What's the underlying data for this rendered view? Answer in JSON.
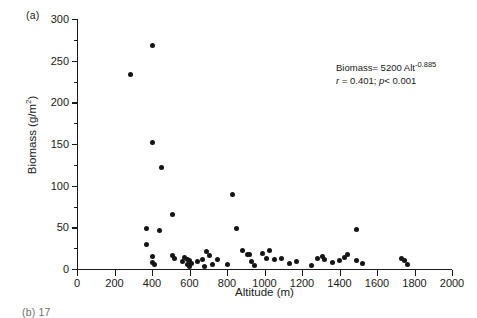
{
  "panel": {
    "label": "(a)",
    "next_panel_stub": "(b)  17"
  },
  "chart_data": {
    "type": "scatter",
    "title": "",
    "xlabel": "Altitude (m)",
    "ylabel": "Biomass (g/m",
    "ylabel_exponent": "2",
    "ylabel_close": ")",
    "xlim": [
      0,
      2000
    ],
    "ylim": [
      0,
      300
    ],
    "xticks": [
      0,
      200,
      400,
      600,
      800,
      1000,
      1200,
      1400,
      1600,
      1800,
      2000
    ],
    "xtick_labels": [
      "0",
      "200",
      "400",
      "600",
      "800",
      "1000",
      "1200",
      "1400",
      "1600",
      "1800",
      "2000"
    ],
    "yticks": [
      0,
      50,
      100,
      150,
      200,
      250,
      300
    ],
    "ytick_labels": [
      "0",
      "50",
      "100",
      "150",
      "200",
      "250",
      "300"
    ],
    "yticks_minor": [
      25,
      75,
      125,
      175,
      225,
      275
    ],
    "grid": false,
    "legend": null,
    "marker": "filled-circle",
    "marker_color": "#151515",
    "points": [
      {
        "x": 287,
        "y": 234
      },
      {
        "x": 400,
        "y": 268
      },
      {
        "x": 400,
        "y": 152
      },
      {
        "x": 453,
        "y": 122
      },
      {
        "x": 507,
        "y": 65
      },
      {
        "x": 373,
        "y": 49
      },
      {
        "x": 440,
        "y": 46
      },
      {
        "x": 373,
        "y": 29
      },
      {
        "x": 400,
        "y": 15
      },
      {
        "x": 400,
        "y": 8
      },
      {
        "x": 413,
        "y": 5
      },
      {
        "x": 507,
        "y": 16
      },
      {
        "x": 520,
        "y": 13
      },
      {
        "x": 560,
        "y": 9
      },
      {
        "x": 573,
        "y": 14
      },
      {
        "x": 587,
        "y": 12
      },
      {
        "x": 587,
        "y": 5
      },
      {
        "x": 600,
        "y": 10
      },
      {
        "x": 600,
        "y": 3
      },
      {
        "x": 613,
        "y": 7
      },
      {
        "x": 640,
        "y": 9
      },
      {
        "x": 667,
        "y": 12
      },
      {
        "x": 680,
        "y": 3
      },
      {
        "x": 693,
        "y": 21
      },
      {
        "x": 707,
        "y": 16
      },
      {
        "x": 720,
        "y": 5
      },
      {
        "x": 747,
        "y": 11
      },
      {
        "x": 800,
        "y": 6
      },
      {
        "x": 827,
        "y": 89
      },
      {
        "x": 853,
        "y": 49
      },
      {
        "x": 880,
        "y": 22
      },
      {
        "x": 907,
        "y": 17
      },
      {
        "x": 920,
        "y": 18
      },
      {
        "x": 933,
        "y": 9
      },
      {
        "x": 947,
        "y": 4
      },
      {
        "x": 987,
        "y": 19
      },
      {
        "x": 1013,
        "y": 13
      },
      {
        "x": 1027,
        "y": 22
      },
      {
        "x": 1053,
        "y": 11
      },
      {
        "x": 1093,
        "y": 13
      },
      {
        "x": 1133,
        "y": 7
      },
      {
        "x": 1173,
        "y": 9
      },
      {
        "x": 1253,
        "y": 4
      },
      {
        "x": 1280,
        "y": 13
      },
      {
        "x": 1307,
        "y": 15
      },
      {
        "x": 1320,
        "y": 12
      },
      {
        "x": 1360,
        "y": 8
      },
      {
        "x": 1400,
        "y": 10
      },
      {
        "x": 1427,
        "y": 14
      },
      {
        "x": 1440,
        "y": 17
      },
      {
        "x": 1493,
        "y": 47
      },
      {
        "x": 1493,
        "y": 10
      },
      {
        "x": 1520,
        "y": 7
      },
      {
        "x": 1733,
        "y": 13
      },
      {
        "x": 1747,
        "y": 10
      },
      {
        "x": 1760,
        "y": 6
      }
    ],
    "annotation": {
      "equation_prefix": "Biomass= 5200 Alt",
      "equation_exponent": "-0.885",
      "stat_r_symbol": "r",
      "stat_r_value": " = 0.401; ",
      "stat_p_symbol": "p",
      "stat_p_value": "< 0.001"
    }
  }
}
